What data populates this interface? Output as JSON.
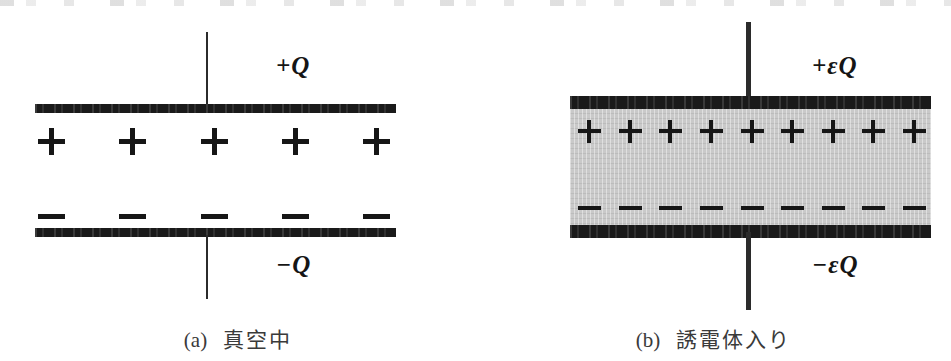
{
  "figure": {
    "background_color": "#ffffff",
    "plate_color": "#1a1a1a",
    "dielectric_color": "#c9c9c9",
    "wire_color": "#2b2b2b",
    "text_color": "#151515"
  },
  "panels": [
    {
      "id": "a",
      "tag": "(a)",
      "caption": "真空中",
      "top_charge_label": "+Q",
      "bottom_charge_label": "−Q",
      "positive_signs": [
        "+",
        "+",
        "+",
        "+",
        "+"
      ],
      "negative_signs": [
        "−",
        "−",
        "−",
        "−",
        "−"
      ],
      "positive_count": 5,
      "negative_count": 5,
      "has_dielectric": false
    },
    {
      "id": "b",
      "tag": "(b)",
      "caption": "誘電体入り",
      "top_charge_label": "+εQ",
      "bottom_charge_label": "−εQ",
      "positive_signs": [
        "+",
        "+",
        "+",
        "+",
        "+",
        "+",
        "+",
        "+",
        "+"
      ],
      "negative_signs": [
        "−",
        "−",
        "−",
        "−",
        "−",
        "−",
        "−",
        "−",
        "−"
      ],
      "positive_count": 9,
      "negative_count": 9,
      "has_dielectric": true
    }
  ]
}
